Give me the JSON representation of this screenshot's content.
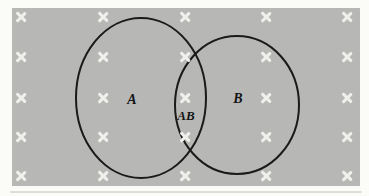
{
  "figure": {
    "type": "venn-diagram",
    "regions": [
      {
        "id": "A",
        "label": "A"
      },
      {
        "id": "AB",
        "label": "AB"
      },
      {
        "id": "B",
        "label": "B"
      }
    ],
    "sample_points": {
      "marker_glyph": "x",
      "columns_px": [
        21,
        103,
        185,
        266,
        347
      ],
      "rows_px": [
        17,
        57,
        98,
        137,
        176
      ]
    },
    "colors": {
      "page_background": "#fbfbf8",
      "panel_background": "#b7b7b5",
      "ellipse_stroke": "#1a1a1a",
      "mark": "#efefec",
      "label_text": "#141414"
    }
  }
}
